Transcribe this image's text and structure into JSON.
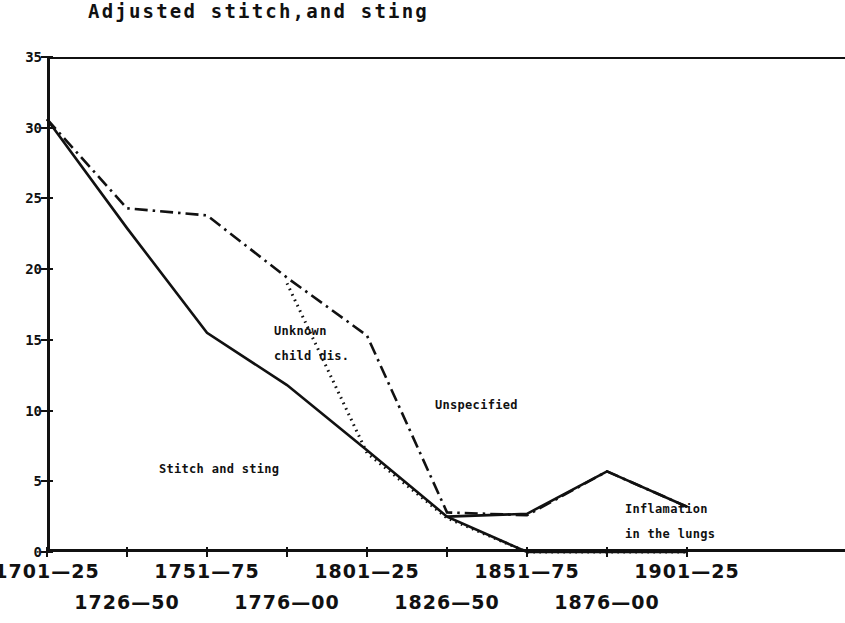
{
  "chart_data": {
    "type": "line",
    "title": "Adjusted stitch,and sting",
    "xlabel": "",
    "ylabel": "",
    "ylim": [
      0,
      35
    ],
    "yticks": [
      0,
      5,
      10,
      15,
      20,
      25,
      30,
      35
    ],
    "grid": false,
    "legend": "inline-annotations",
    "categories": [
      "1701—25",
      "1726—50",
      "1751—75",
      "1776—00",
      "1801—25",
      "1826—50",
      "1851—75",
      "1876—00",
      "1901—25"
    ],
    "series": [
      {
        "name": "Stitch and sting",
        "style": "solid",
        "values": [
          30.6,
          22.9,
          15.5,
          11.8,
          7.2,
          2.5,
          0.0,
          0.0,
          0.0
        ]
      },
      {
        "name": "Unknown child dis.",
        "style": "dash-dot",
        "values": [
          30.6,
          24.3,
          23.8,
          19.4,
          15.3,
          2.8,
          2.6,
          5.7,
          3.2
        ]
      },
      {
        "name": "Unspecified",
        "style": "dotted",
        "values": [
          null,
          null,
          null,
          19.0,
          7.0,
          2.4,
          0.0,
          0.0,
          0.0
        ]
      },
      {
        "name": "Inflamation in the lungs",
        "style": "solid-rising",
        "values": [
          null,
          null,
          null,
          null,
          null,
          2.5,
          2.7,
          5.7,
          3.2
        ]
      }
    ],
    "annotations": [
      {
        "text": "Unknown",
        "x": 1801,
        "y": 19.8
      },
      {
        "text": "child dis.",
        "x": 1801,
        "y": 18.0
      },
      {
        "text": "Unspecified",
        "x": 1820,
        "y": 11.0
      },
      {
        "text": "Stitch and sting",
        "x": 1740,
        "y": 5.5
      },
      {
        "text": "Inflamation",
        "x": 1865,
        "y": 3.5
      },
      {
        "text": "in the lungs",
        "x": 1865,
        "y": 2.0
      }
    ]
  },
  "title": "Adjusted stitch,and sting",
  "yaxis": {
    "ticks": [
      "35",
      "30",
      "25",
      "20",
      "15",
      "10",
      "5",
      "0"
    ]
  },
  "xaxis": {
    "labels": [
      {
        "text": "1701—25",
        "row": 0
      },
      {
        "text": "1726—50",
        "row": 1
      },
      {
        "text": "1751—75",
        "row": 0
      },
      {
        "text": "1776—00",
        "row": 1
      },
      {
        "text": "1801—25",
        "row": 0
      },
      {
        "text": "1826—50",
        "row": 1
      },
      {
        "text": "1851—75",
        "row": 0
      },
      {
        "text": "1876—00",
        "row": 1
      },
      {
        "text": "1901—25",
        "row": 0
      }
    ]
  },
  "annotations": {
    "unknown_l1": "Unknown",
    "unknown_l2": "child dis.",
    "unspecified": "Unspecified",
    "stitch": "Stitch and sting",
    "inflamation_l1": "Inflamation",
    "inflamation_l2": "in the lungs"
  },
  "colors": {
    "ink": "#111111",
    "background": "#ffffff"
  }
}
